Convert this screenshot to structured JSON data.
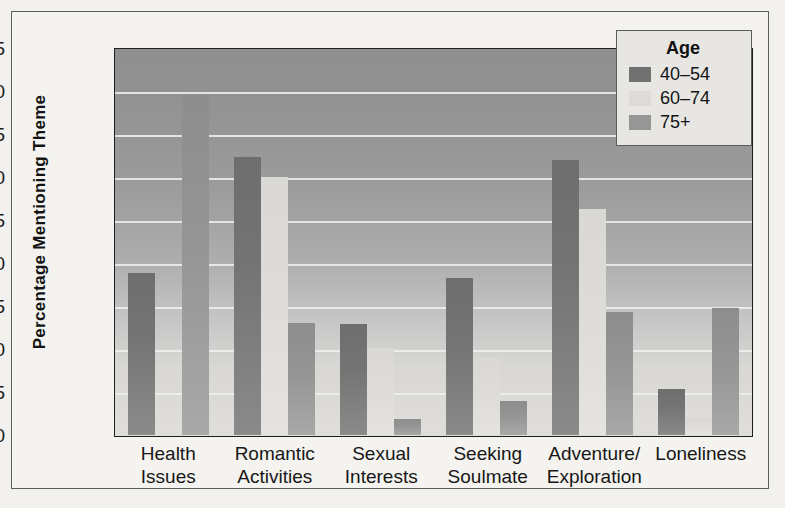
{
  "chart_data": {
    "type": "bar",
    "title": "",
    "xlabel": "",
    "ylabel": "Percentage Mentioning Theme",
    "ylim": [
      0,
      45
    ],
    "ytick_step": 5,
    "yticks": [
      "45",
      "40",
      "35",
      "30",
      "25",
      "20",
      "15",
      "10",
      "5",
      "0"
    ],
    "grid": true,
    "legend_position": "top-right",
    "legend_title": "Age",
    "categories": [
      "Health\nIssues",
      "Romantic\nActivities",
      "Sexual\nInterests",
      "Seeking\nSoulmate",
      "Adventure/\nExploration",
      "Loneliness"
    ],
    "category_lines": [
      [
        "Health",
        "Issues"
      ],
      [
        "Romantic",
        "Activities"
      ],
      [
        "Sexual",
        "Interests"
      ],
      [
        "Seeking",
        "Soulmate"
      ],
      [
        "Adventure/",
        "Exploration"
      ],
      [
        "Loneliness"
      ]
    ],
    "series": [
      {
        "name": "40–54",
        "color": "#717171",
        "values": [
          18.8,
          32.3,
          12.9,
          18.3,
          32.0,
          5.3
        ]
      },
      {
        "name": "60–74",
        "color": "#dcdbd8",
        "values": [
          0.2,
          30.0,
          10.1,
          9.0,
          26.3,
          2.0
        ]
      },
      {
        "name": "75+",
        "color": "#969696",
        "values": [
          39.6,
          13.0,
          1.9,
          3.9,
          14.3,
          14.8
        ]
      }
    ]
  },
  "legend": {
    "title": "Age",
    "entries": [
      {
        "label": "40–54"
      },
      {
        "label": "60–74"
      },
      {
        "label": "75+"
      }
    ]
  },
  "axis": {
    "y_title": "Percentage Mentioning Theme"
  }
}
